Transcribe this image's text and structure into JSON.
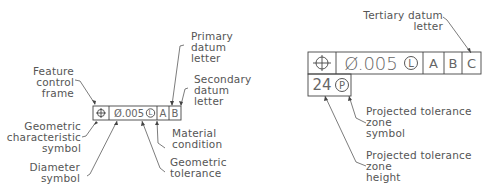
{
  "left_frame": {
    "symbol": "position-symbol",
    "tolerance": "Ø.005",
    "modifier": "L",
    "datums": [
      "A",
      "B"
    ]
  },
  "right_frame": {
    "symbol": "position-symbol",
    "tolerance": "Ø.005",
    "modifier": "L",
    "datums": [
      "A",
      "B",
      "C"
    ],
    "projected_height": "24",
    "projected_symbol": "P"
  },
  "labels": {
    "feature_control_frame": "Feature\ncontrol\nframe",
    "geometric_characteristic_symbol": "Geometric\ncharacteristic\nsymbol",
    "diameter_symbol": "Diameter\nsymbol",
    "primary_datum_letter": "Primary\ndatum\nletter",
    "secondary_datum_letter": "Secondary\ndatum\nletter",
    "material_condition": "Material\ncondition",
    "geometric_tolerance": "Geometric\ntolerance",
    "tertiary_datum_letter": "Tertiary datum\nletter",
    "projected_tolerance_zone_symbol": "Projected tolerance\nzone\nsymbol",
    "projected_tolerance_zone_height": "Projected tolerance\nzone\nheight"
  },
  "colors": {
    "line": "#444444",
    "text": "#555555",
    "background": "#ffffff"
  }
}
